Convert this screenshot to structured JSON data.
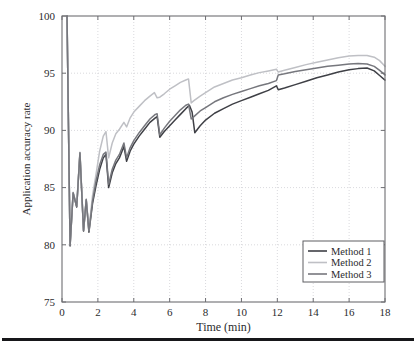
{
  "figure": {
    "background_color": "#ffffff",
    "axis_color": "#6e6e72",
    "grid_color": "#cfcfd4",
    "bottom_rule_color": "#17171a",
    "has_bottom_rule": true
  },
  "chart_data": {
    "type": "line",
    "title": "",
    "xlabel": "Time (min)",
    "ylabel": "Application accuracy rate",
    "xlim": [
      0,
      18
    ],
    "ylim": [
      75,
      100
    ],
    "xticks": [
      0,
      2,
      4,
      6,
      8,
      10,
      12,
      14,
      16,
      18
    ],
    "yticks": [
      75,
      80,
      85,
      90,
      95,
      100
    ],
    "xtick_labels": [
      "0",
      "2",
      "4",
      "6",
      "8",
      "10",
      "12",
      "14",
      "16",
      "18"
    ],
    "ytick_labels": [
      "75",
      "80",
      "85",
      "90",
      "95",
      "100"
    ],
    "grid": true,
    "grid_style": "dotted",
    "legend_position": "lower right",
    "legend_entries": [
      "Method 1",
      "Method 2",
      "Method 3"
    ],
    "series": [
      {
        "name": "Method 1",
        "color": "#3f4046",
        "width": 1.5,
        "x": [
          0.28,
          0.45,
          0.62,
          0.82,
          1.0,
          1.2,
          1.35,
          1.5,
          1.7,
          1.9,
          2.1,
          2.3,
          2.45,
          2.6,
          2.8,
          3.0,
          3.2,
          3.45,
          3.6,
          3.8,
          4.0,
          4.3,
          4.6,
          4.9,
          5.2,
          5.3,
          5.45,
          5.7,
          6.0,
          6.3,
          6.6,
          6.9,
          7.1,
          7.25,
          7.4,
          7.7,
          8.0,
          8.5,
          9.0,
          9.5,
          10.0,
          10.5,
          11.0,
          11.5,
          11.95,
          12.05,
          12.4,
          13.0,
          13.6,
          14.2,
          14.8,
          15.4,
          16.0,
          16.5,
          17.0,
          17.4,
          17.7,
          18.0
        ],
        "y": [
          100.0,
          79.9,
          84.5,
          83.3,
          88.0,
          81.2,
          83.9,
          81.1,
          83.6,
          85.2,
          86.6,
          87.6,
          87.9,
          85.0,
          86.3,
          87.1,
          87.6,
          88.6,
          87.3,
          88.2,
          88.8,
          89.5,
          90.1,
          90.7,
          91.1,
          91.2,
          89.4,
          89.9,
          90.4,
          90.9,
          91.4,
          91.9,
          92.2,
          91.6,
          89.8,
          90.4,
          90.9,
          91.5,
          91.9,
          92.3,
          92.6,
          92.9,
          93.2,
          93.5,
          93.9,
          93.55,
          93.7,
          94.0,
          94.3,
          94.6,
          94.85,
          95.1,
          95.3,
          95.4,
          95.45,
          95.2,
          94.8,
          94.4
        ]
      },
      {
        "name": "Method 2",
        "color": "#bfc0c5",
        "width": 1.5,
        "x": [
          0.28,
          0.45,
          0.62,
          0.82,
          1.0,
          1.2,
          1.35,
          1.5,
          1.7,
          1.9,
          2.1,
          2.3,
          2.45,
          2.6,
          2.8,
          3.0,
          3.2,
          3.45,
          3.6,
          3.8,
          4.0,
          4.3,
          4.6,
          4.9,
          5.15,
          5.3,
          5.45,
          5.7,
          6.0,
          6.3,
          6.6,
          6.9,
          7.05,
          7.2,
          7.35,
          7.7,
          8.0,
          8.5,
          9.0,
          9.5,
          10.0,
          10.5,
          11.0,
          11.5,
          11.95,
          12.05,
          12.4,
          13.0,
          13.6,
          14.2,
          14.8,
          15.4,
          16.0,
          16.5,
          17.0,
          17.4,
          17.7,
          18.0
        ],
        "y": [
          100.0,
          80.0,
          84.6,
          83.4,
          88.1,
          81.3,
          84.0,
          81.3,
          84.3,
          86.2,
          88.2,
          89.5,
          89.9,
          87.6,
          88.9,
          89.7,
          90.1,
          90.7,
          90.3,
          91.1,
          91.6,
          92.1,
          92.6,
          93.0,
          93.3,
          92.85,
          92.9,
          93.2,
          93.6,
          93.9,
          94.2,
          94.4,
          94.5,
          92.4,
          92.6,
          93.0,
          93.3,
          93.8,
          94.1,
          94.4,
          94.6,
          94.85,
          95.05,
          95.2,
          95.35,
          95.1,
          95.25,
          95.5,
          95.75,
          95.95,
          96.15,
          96.35,
          96.5,
          96.55,
          96.55,
          96.4,
          96.1,
          95.6
        ]
      },
      {
        "name": "Method 3",
        "color": "#76777d",
        "width": 1.5,
        "x": [
          0.28,
          0.45,
          0.62,
          0.82,
          1.0,
          1.2,
          1.35,
          1.5,
          1.7,
          1.9,
          2.1,
          2.3,
          2.45,
          2.6,
          2.8,
          3.0,
          3.2,
          3.45,
          3.6,
          3.8,
          4.0,
          4.3,
          4.6,
          4.9,
          5.2,
          5.3,
          5.45,
          5.7,
          6.0,
          6.3,
          6.6,
          6.9,
          7.05,
          7.2,
          7.35,
          7.7,
          8.0,
          8.5,
          9.0,
          9.5,
          10.0,
          10.5,
          11.0,
          11.5,
          11.95,
          12.05,
          12.4,
          13.0,
          13.6,
          14.2,
          14.8,
          15.4,
          16.0,
          16.5,
          17.0,
          17.4,
          17.7,
          18.0
        ],
        "y": [
          100.0,
          79.95,
          84.55,
          83.35,
          88.05,
          81.25,
          83.95,
          81.2,
          83.8,
          85.6,
          87.0,
          87.9,
          88.1,
          85.3,
          86.6,
          87.4,
          87.9,
          88.9,
          87.6,
          88.5,
          89.1,
          89.8,
          90.4,
          91.0,
          91.4,
          91.45,
          89.6,
          90.2,
          90.8,
          91.3,
          91.8,
          92.2,
          92.3,
          91.0,
          91.2,
          91.7,
          92.0,
          92.5,
          92.85,
          93.15,
          93.4,
          93.65,
          93.9,
          94.1,
          94.35,
          94.85,
          94.95,
          95.15,
          95.3,
          95.45,
          95.6,
          95.7,
          95.8,
          95.85,
          95.8,
          95.6,
          95.25,
          94.85
        ]
      }
    ]
  }
}
